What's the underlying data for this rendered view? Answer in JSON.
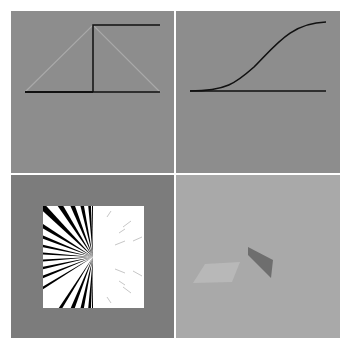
{
  "figure": {
    "layout": "2x2 grid",
    "panels": [
      {
        "id": "top-left",
        "description": "step function (black) with triangular hat function (light gray)",
        "background": "#8d8d8d",
        "step_color": "#111111",
        "hat_color": "#a9a9a9"
      },
      {
        "id": "top-right",
        "description": "smooth sigmoid curve above baseline",
        "background": "#8d8d8d",
        "curve_color": "#111111"
      },
      {
        "id": "bottom-left",
        "description": "radial sunburst pattern: black/white rays on left half, faint rays on white right half",
        "background": "#7c7c7c",
        "square_color": "#ffffff",
        "ray_color": "#000000"
      },
      {
        "id": "bottom-right",
        "description": "3D rendered scene: light flat quad and dark vertical quad on gray ground",
        "background": "#a9a9a9",
        "light_quad_color": "#b8b8b8",
        "dark_quad_color": "#6e6e6e"
      }
    ]
  }
}
